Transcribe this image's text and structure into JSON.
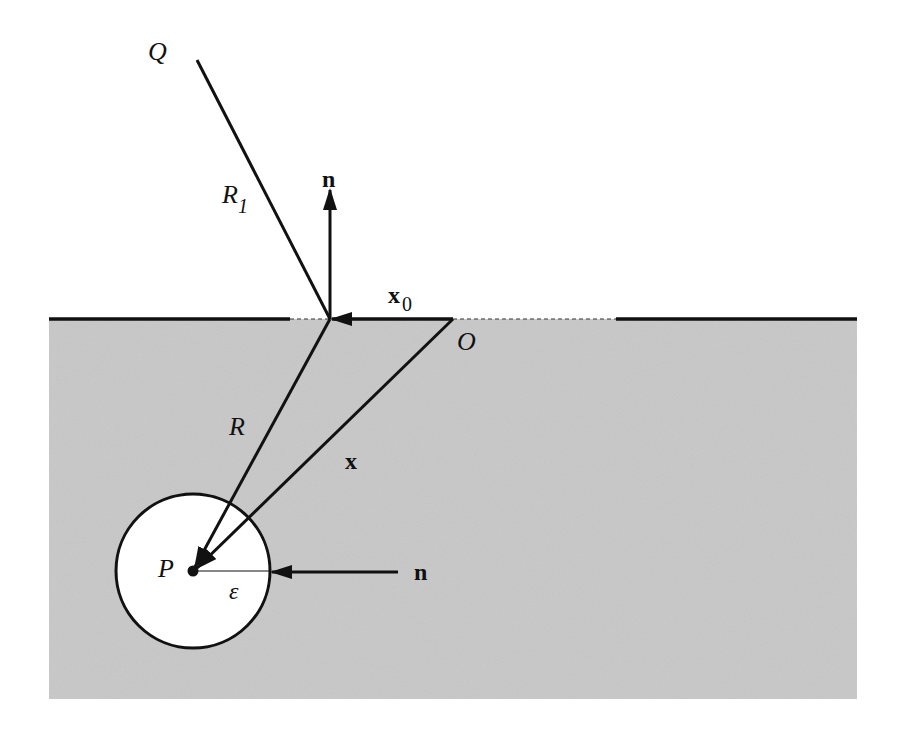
{
  "diagram": {
    "type": "geometry",
    "colors": {
      "region": "#c9c9c9",
      "line": "#111111",
      "background": "#ffffff",
      "sphere": "#ffffff"
    },
    "labels": {
      "Q": "Q",
      "R1": "R",
      "R1_sub": "1",
      "n_top": "n",
      "x0": "x",
      "x0_sub": "0",
      "O": "O",
      "R": "R",
      "x": "x",
      "P": "P",
      "epsilon": "ε",
      "n_right": "n"
    },
    "points": {
      "Q_end": [
        197,
        60
      ],
      "surface_point": [
        330,
        319
      ],
      "O": [
        453,
        319
      ],
      "P": [
        193,
        571
      ]
    },
    "sphere_radius": 77
  }
}
